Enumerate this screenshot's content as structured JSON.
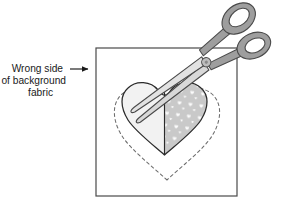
{
  "figure": {
    "background_color": "#ffffff",
    "line_color": "#3a3a3a",
    "text_color": "#1a1a1a"
  },
  "callout": {
    "name": "wrong-side-callout",
    "lines": [
      "Wrong side",
      "of background",
      "fabric"
    ],
    "line1": "Wrong side",
    "line2": "of background",
    "line3": "fabric",
    "leader_line": true,
    "arrow_head": "right-arrow",
    "arrow_target_x": 97,
    "arrow_target_y": 70
  },
  "fabric_square": {
    "name": "background-fabric-square",
    "label": "background fabric",
    "x": 96,
    "y": 48,
    "width": 141,
    "height": 148,
    "stroke": "#4a4a4a",
    "fill": "#ffffff"
  },
  "cut_line": {
    "name": "dashed-cutting-line",
    "style": "dashed",
    "shape": "heart",
    "stroke": "#6b6b6b",
    "dash_pattern": "3 3"
  },
  "applique_heart": {
    "name": "applique-heart",
    "shape": "heart",
    "stroke": "#2b2b2b",
    "left_half_fill": "#f2f2f2",
    "right_half_fill": "#c9c9c9",
    "right_half_pattern": "small-hearts",
    "pattern_motif_fill": "#ffffff"
  },
  "scissors": {
    "name": "scissors",
    "blade_fill": "#d8d8d8",
    "handle_fill": "#9e9e9e",
    "stroke": "#4a4a4a",
    "pivot": {
      "x": 206,
      "y": 60,
      "fill": "#bdbdbd"
    },
    "loops": [
      {
        "name": "scissors-loop-upper",
        "cx": 228,
        "cy": 26
      },
      {
        "name": "scissors-loop-lower",
        "cx": 259,
        "cy": 46
      }
    ],
    "blade_tip_x": 130,
    "blade_tip_y": 86,
    "rotation_deg": -33
  }
}
